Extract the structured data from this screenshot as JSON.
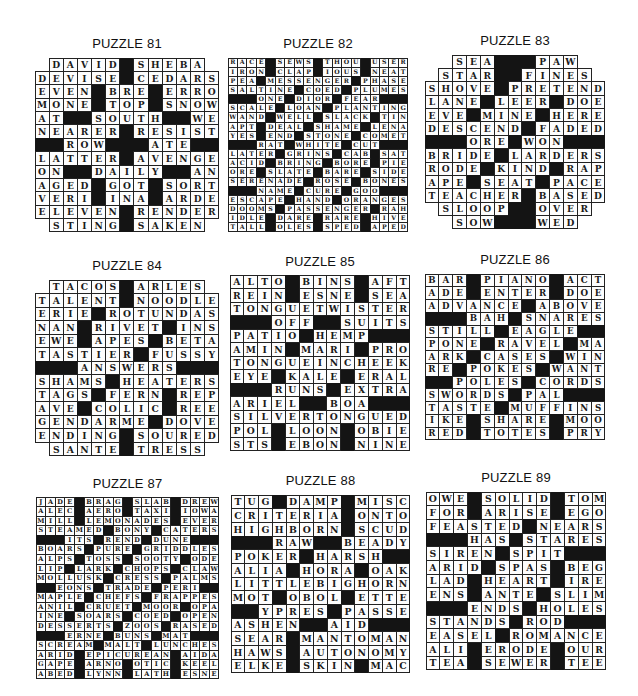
{
  "page": {
    "puzzles": [
      {
        "title": "PUZZLE 81",
        "cols": 13,
        "rows": [
          " DAVID#SHEBA ",
          "DEVISE#CEDARS",
          "EVEN#BRE#ERRO",
          "MONE#TOP#SNOW",
          "AT##SOUTH##WE",
          "NEARER#RESIST",
          "##ROW###ATE##",
          "LATTER#AVENGE",
          "ON##DAILY##AN",
          "AGED#GOT#SORT",
          "VERI#INA#ARDE",
          "ELEVEN#RENDER",
          " STING#SAKEN "
        ]
      },
      {
        "title": "PUZZLE 82",
        "cols": 19,
        "rows": [
          "RACE#SEWS#THOU#USER",
          "IRON#CLAP#IOUS#NEAT",
          "PEA#MESSENGER#PHASE",
          "SALTINE#COED#PLUMES",
          "###ONE#DIOR#FEAR###",
          "SCALE#LOAN#PLANTING",
          "WAND#WELL#SLACK#TIN",
          "APT#DEAL#SHAME#LENA",
          "YES#END#STONE#COMET",
          "###RAT#WHITE#CUT###",
          "LATER#GRINS#CAB#SAT",
          "ACID#BRING#BORE#PIE",
          "ORE#SLATE#BARE#SIDE",
          "SERENADE#ROSE#BONES",
          "###NAME#CURE#GOO###",
          "ESCAPE#HAND#ORANGES",
          "DOOMS#PASSENGER#RAH",
          "IDLE#DARE#RARE#HIVE",
          "TALL#OLES#SPED#APED"
        ]
      },
      {
        "title": "PUZZLE 83",
        "cols": 13,
        "rows": [
          "  SEA###PAW  ",
          " STAR##FINES ",
          "SHOVE#PRETEND",
          "LANE#LEER#DOE",
          "EVE#MINE#HERE",
          "DESCEND#FADED",
          "###ORE#WON###",
          "BRIDE#LARDERS",
          "RODE#KIND#RAP",
          "APE#SEAT#PACE",
          "TEACHER#BASED",
          " SLOOP##OVER ",
          "  SOW###WED  "
        ]
      },
      {
        "title": "PUZZLE 84",
        "cols": 13,
        "rows": [
          " TACOS#ARLES ",
          "TALENT#NOODLE",
          "ERIE#ROTUNDAS",
          "NAN#RIVET#INS",
          "EWE#APES#BETA",
          "TASTIER#FUSSY",
          "###ANSWERS###",
          "SHAMS#HEATERS",
          "TAGS#FERN#REP",
          "AVE#COLIC#REE",
          "GENDARME#DOVE",
          "ENDING#SOURED",
          " SANTE#TRESS "
        ]
      },
      {
        "title": "PUZZLE 85",
        "cols": 13,
        "rows": [
          "ALTO#BINS#AFT",
          "REIN#ESNE#SEA",
          "TONGUETWISTER",
          "###OFF##SUITS",
          "PATIO#HEMP###",
          "AMIN#MARI#PRO",
          "TONGUEINCHEEK",
          "EYE#KALE#ERAL",
          "###RUNS#EXTRA",
          "ARIEL##BOA###",
          "SILVERTONGUED",
          "POL#LOON#OBIE",
          "STS#EBON#NINE"
        ]
      },
      {
        "title": "PUZZLE 86",
        "cols": 13,
        "rows": [
          "BAR#PIANO#ACT",
          "ADE#ENTER#DOE",
          "ADVANCE#ABOVE",
          "###BAH#SNARES",
          "STILL#EAGLE##",
          "PONE#RAVEL#MA",
          "ARK#CASES#WIN",
          "RE#POKES#WANT",
          "##POLES#CORDS",
          "SWORDS#PAL###",
          "TASTE#MUFFINS",
          "IKE#SHARE#MOO",
          "RED#TOTES#PRY"
        ]
      },
      {
        "title": "PUZZLE 87",
        "cols": 19,
        "rows": [
          "JADE#BRAG#SLAB#DREW",
          "ALEC#AERO#TAXI#IOWA",
          "MILL#LEMONADES#EVER",
          "STEAMED#BONY#CATERS",
          "###ITS#REND#DUNE###",
          "BOARS#PURE#GRIDDLES",
          "ALPS#TOSS#SOOTY#ODE",
          "LIP#LARK#CHOPS#CLAW",
          "MOLLUSK#CRESS#PALMS",
          "##EONS#TRADE#PERI##",
          "MAPLE#CHEFS#FRAPPES",
          "ANIL#CRUET#MOOR#OPA",
          "INE#SOARS#COED#OPEN",
          "DESSERTS#ZOOS#RASED",
          "###ERNE#BUNS#MAT###",
          "SCREAM#MALT#LUNCHES",
          "ARID#EPICUREAN#AIDA",
          "GAPE#ARNO#OTIC#KEEL",
          "ABED#LYNN#LATH#ESNE"
        ]
      },
      {
        "title": "PUZZLE 88",
        "cols": 13,
        "rows": [
          "TUG#DAMP#MISC",
          "CRITERIA#ONTO",
          "HIGHBORN#SCUD",
          "###RAW##BEADY",
          "POKER#HARSH##",
          "ALIA#HORA#OAK",
          "LITTLEBIGHORN",
          "MOT#OBOL#ETTE",
          "##YPRES#PASSE",
          "ASHEN##AID###",
          "SEAR#MANTOMAN",
          "HAWS#AUTONOMY",
          "ELKE#SKIN#MAC"
        ]
      },
      {
        "title": "PUZZLE 89",
        "cols": 13,
        "rows": [
          "OWE#SOLID#TOM",
          "FOR#ARISE#EGO",
          "FEASTED#NEARS",
          "###HAS#STARES",
          "SIREN#SPIT###",
          "ARID#SPAS#BEG",
          "LAD#HEART#IRE",
          "ENS#ANTE#SLIM",
          "###ENDS#HOLES",
          "STANDS#ROD###",
          "EASEL#ROMANCE",
          "ALI#ERODE#OUR",
          "TEA#SEWER#TEE"
        ]
      }
    ]
  }
}
